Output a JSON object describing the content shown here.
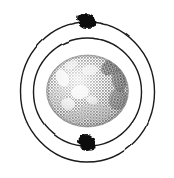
{
  "figure": {
    "alt_text": "Halftone illustration of a grey textured sphere encircled by two concentric orbit rings, with a dark blob on the top of the outer ring and a dark blob on the bottom of the inner ring",
    "background_color": "#ffffff",
    "width": 174,
    "height": 178,
    "style": "halftone-engraving"
  },
  "chart_data": {
    "type": "scatter",
    "xlabel": "",
    "ylabel": "",
    "xlim": [
      0,
      174
    ],
    "ylim": [
      0,
      178
    ],
    "grid": false,
    "legend": "none",
    "center": {
      "x": 87.5,
      "y": 92
    },
    "series": [
      {
        "name": "nucleus",
        "shape": "sphere",
        "cx": 87.5,
        "cy": 91,
        "rx": 41,
        "ry": 36,
        "fill": "#b0b0b0",
        "texture": "halftone-mottled"
      },
      {
        "name": "outer-orbit",
        "shape": "ellipse",
        "cx": 87.5,
        "cy": 92,
        "rx": 67,
        "ry": 70,
        "stroke": "#1a1a1a",
        "stroke_width": 1.4,
        "fill": "none"
      },
      {
        "name": "inner-orbit",
        "shape": "ellipse",
        "cx": 87.5,
        "cy": 92,
        "rx": 54,
        "ry": 54,
        "stroke": "#1a1a1a",
        "stroke_width": 1.4,
        "fill": "none"
      },
      {
        "name": "particle-top",
        "shape": "blob",
        "cx": 87,
        "cy": 21,
        "rx": 9,
        "ry": 7,
        "fill": "#0d0d0d",
        "on_orbit": "outer-orbit"
      },
      {
        "name": "particle-bottom",
        "shape": "blob",
        "cx": 87,
        "cy": 143,
        "rx": 8,
        "ry": 8,
        "fill": "#0d0d0d",
        "on_orbit": "inner-orbit"
      }
    ],
    "surface_features": [
      {
        "name": "dark-patch-upper-right",
        "cx": 113,
        "cy": 66,
        "rx": 13,
        "ry": 8,
        "shade": "#2e2e2e"
      },
      {
        "name": "dark-patch-right-limb",
        "cx": 119,
        "cy": 80,
        "rx": 7,
        "ry": 12,
        "shade": "#3a3a3a"
      },
      {
        "name": "dark-patch-lower-center",
        "cx": 95,
        "cy": 112,
        "rx": 16,
        "ry": 9,
        "shade": "#6b6b6b"
      },
      {
        "name": "light-patch-left",
        "cx": 62,
        "cy": 78,
        "rx": 6,
        "ry": 9,
        "shade": "#f2f2f2"
      },
      {
        "name": "light-patch-center",
        "cx": 80,
        "cy": 92,
        "rx": 9,
        "ry": 7,
        "shade": "#f5f5f5"
      },
      {
        "name": "light-patch-lower-left",
        "cx": 68,
        "cy": 104,
        "rx": 7,
        "ry": 6,
        "shade": "#efefef"
      },
      {
        "name": "light-patch-upper-center",
        "cx": 90,
        "cy": 70,
        "rx": 8,
        "ry": 5,
        "shade": "#e8e8e8"
      }
    ],
    "colors": {
      "ink": "#1a1a1a",
      "particle": "#0d0d0d",
      "sphere_mid": "#b8b8b8",
      "sphere_light": "#efefef",
      "sphere_dark": "#5a5a5a",
      "background": "#ffffff"
    }
  }
}
